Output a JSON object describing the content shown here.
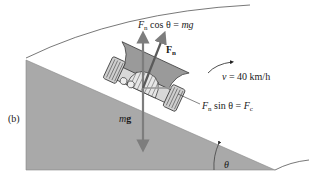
{
  "figure": {
    "panel_label": "(b)",
    "colors": {
      "incline": "#a9a9a9",
      "incline_edge": "#7a7a7a",
      "car_body": "#9a9a9a",
      "car_dark": "#3a3a3a",
      "arrow": "#7d7d7d",
      "curve_line": "#555555",
      "text": "#1a1a1a"
    },
    "labels": {
      "normal_vertical": {
        "symbol": "F",
        "sub": "n",
        "text": " cos θ = ",
        "rhs": "mg"
      },
      "normal_force": {
        "symbol": "F",
        "sub": "n"
      },
      "velocity": {
        "var": "v",
        "text": " = 40 km/h"
      },
      "weight": {
        "symbol": "m",
        "bold": "g"
      },
      "normal_horizontal": {
        "symbol": "F",
        "sub": "n",
        "text": " sin θ = ",
        "rhs_symbol": "F",
        "rhs_sub": "c"
      },
      "angle": "θ"
    }
  }
}
